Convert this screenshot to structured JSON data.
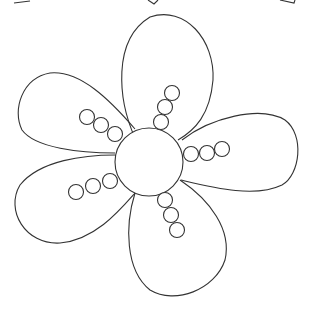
{
  "image": {
    "subject": "flower line-art coloring page",
    "petal_count": 5,
    "beads_per_petal": 3,
    "colors": {
      "background": "#ffffff",
      "line": "#333333"
    }
  }
}
